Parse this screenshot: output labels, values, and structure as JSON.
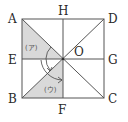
{
  "diagram": {
    "type": "geometry-square",
    "points": {
      "A": {
        "label": "A",
        "x": 22,
        "y": 19
      },
      "D": {
        "label": "D",
        "x": 104,
        "y": 19
      },
      "B": {
        "label": "B",
        "x": 22,
        "y": 98
      },
      "C": {
        "label": "C",
        "x": 104,
        "y": 98
      },
      "H": {
        "label": "H",
        "x": 63,
        "y": 19
      },
      "F": {
        "label": "F",
        "x": 63,
        "y": 98
      },
      "E": {
        "label": "E",
        "x": 22,
        "y": 59
      },
      "G": {
        "label": "G",
        "x": 104,
        "y": 59
      },
      "O": {
        "label": "O",
        "x": 63,
        "y": 59
      }
    },
    "shaded_regions": [
      {
        "name": "ア",
        "label": "(ア)",
        "vertices": [
          "A",
          "E",
          "O"
        ]
      },
      {
        "name": "ウ",
        "label": "(ウ)",
        "vertices": [
          "B",
          "F",
          "O"
        ]
      }
    ],
    "colors": {
      "shade": "#d9d9d9",
      "line": "#555555",
      "text": "#2a2a2a"
    }
  }
}
